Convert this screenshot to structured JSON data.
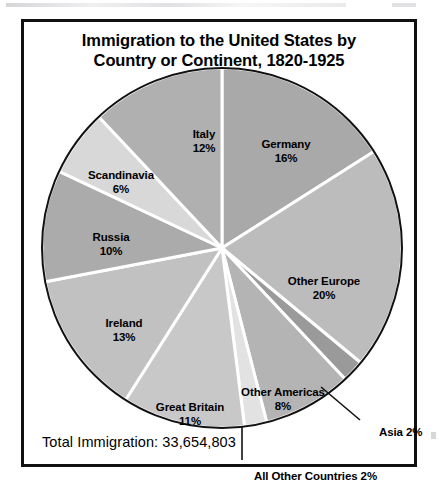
{
  "figure": {
    "title_line1": "Immigration to the United States by",
    "title_line2": "Country or Continent, 1820-1925",
    "total_label": "Total Immigration: 33,654,803"
  },
  "chart_data": {
    "type": "pie",
    "title": "Immigration to the United States by Country or Continent, 1820-1925",
    "subtitle": "",
    "xlabel": "",
    "ylabel": "",
    "units": "percent of total immigration",
    "total_value": 33654803,
    "total_text": "Total Immigration: 33,654,803",
    "legend_position": "none",
    "grid": false,
    "labels_inside_slices": true,
    "start_angle_deg": 0,
    "direction": "clockwise",
    "categories": [
      "Germany",
      "Other Europe",
      "Asia",
      "Other Americas",
      "All Other Countries",
      "Great Britain",
      "Ireland",
      "Russia",
      "Scandinavia",
      "Italy"
    ],
    "values": [
      16,
      20,
      2,
      8,
      2,
      11,
      13,
      10,
      6,
      12
    ],
    "slices": [
      {
        "name": "Germany",
        "percent": 16,
        "label": "Germany",
        "percent_text": "16%",
        "color": "#a9a9a9",
        "label_x": 262,
        "label_y": 115,
        "callout": false
      },
      {
        "name": "Other Europe",
        "percent": 20,
        "label": "Other Europe",
        "percent_text": "20%",
        "color": "#bcbcbc",
        "label_x": 300,
        "label_y": 252,
        "callout": false
      },
      {
        "name": "Asia",
        "percent": 2,
        "label": "Asia",
        "percent_text": "2%",
        "color": "#9a9a9a",
        "label_x": 355,
        "label_y": 404,
        "callout": true
      },
      {
        "name": "Other Americas",
        "percent": 8,
        "label": "Other Americas",
        "percent_text": "8%",
        "color": "#b4b4b4",
        "label_x": 259,
        "label_y": 363,
        "callout": false
      },
      {
        "name": "All Other Countries",
        "percent": 2,
        "label": "All Other Countries",
        "percent_text": "2%",
        "color": "#e2e2e2",
        "label_x": 230,
        "label_y": 448,
        "callout": true
      },
      {
        "name": "Great Britain",
        "percent": 11,
        "label": "Great Britain",
        "percent_text": "11%",
        "color": "#c8c8c8",
        "label_x": 166,
        "label_y": 378,
        "callout": false
      },
      {
        "name": "Ireland",
        "percent": 13,
        "label": "Ireland",
        "percent_text": "13%",
        "color": "#c1c1c1",
        "label_x": 100,
        "label_y": 294,
        "callout": false
      },
      {
        "name": "Russia",
        "percent": 10,
        "label": "Russia",
        "percent_text": "10%",
        "color": "#ababab",
        "label_x": 87,
        "label_y": 208,
        "callout": false
      },
      {
        "name": "Scandinavia",
        "percent": 6,
        "label": "Scandinavia",
        "percent_text": "6%",
        "color": "#d8d8d8",
        "label_x": 97,
        "label_y": 146,
        "callout": false
      },
      {
        "name": "Italy",
        "percent": 12,
        "label": "Italy",
        "percent_text": "12%",
        "color": "#b0b0b0",
        "label_x": 180,
        "label_y": 105,
        "callout": false
      }
    ],
    "callouts": [
      {
        "name": "Asia",
        "text": "Asia  2%"
      },
      {
        "name": "All Other Countries",
        "text": "All Other Countries  2%"
      }
    ]
  },
  "colors": {
    "frame": "#111111",
    "background": "#ffffff",
    "slice_divider": "#ffffff",
    "pie_outline": "#111111",
    "text": "#000000"
  }
}
